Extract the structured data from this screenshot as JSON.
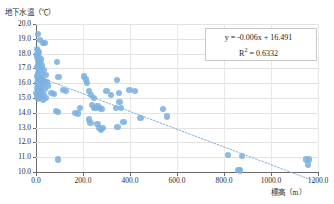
{
  "chart_data": {
    "type": "scatter",
    "title": "",
    "ylabel": "地下水温（℃）",
    "xlabel": "標高（m）",
    "xlim": [
      0,
      1200
    ],
    "ylim": [
      10.0,
      20.0
    ],
    "xticks": [
      "0.0",
      "200.0",
      "400.0",
      "600.0",
      "800.0",
      "1000.0",
      "1200.0"
    ],
    "xtick_values": [
      0,
      200,
      400,
      600,
      800,
      1000,
      1200
    ],
    "yticks": [
      "10.0",
      "11.0",
      "12.0",
      "13.0",
      "14.0",
      "15.0",
      "16.0",
      "17.0",
      "18.0",
      "19.0",
      "20.0"
    ],
    "ytick_values": [
      10,
      11,
      12,
      13,
      14,
      15,
      16,
      17,
      18,
      19,
      20
    ],
    "grid": true,
    "legend": "none",
    "marker_color": "#7cb0e0",
    "trendline_color": "#7cb0e0",
    "trendline": {
      "equation": "y = -0.006x + 16.491",
      "r_squared_label": "R",
      "r_squared_sup": "2",
      "r_squared_value": "= 0.6332",
      "slope": -0.006,
      "intercept": 16.491,
      "r2": 0.6332,
      "x_start": 0,
      "x_end": 1200
    },
    "points": [
      [
        8,
        19.3
      ],
      [
        18,
        18.9
      ],
      [
        30,
        18.7
      ],
      [
        36,
        18.7
      ],
      [
        5,
        18.3
      ],
      [
        9,
        18.2
      ],
      [
        12,
        18.1
      ],
      [
        6,
        17.95
      ],
      [
        4,
        17.8
      ],
      [
        14,
        17.75
      ],
      [
        22,
        17.6
      ],
      [
        8,
        17.5
      ],
      [
        88,
        17.45
      ],
      [
        16,
        17.4
      ],
      [
        10,
        17.25
      ],
      [
        26,
        17.2
      ],
      [
        5,
        17.1
      ],
      [
        19,
        17.0
      ],
      [
        34,
        16.9
      ],
      [
        12,
        16.85
      ],
      [
        7,
        16.7
      ],
      [
        24,
        16.6
      ],
      [
        41,
        16.55
      ],
      [
        96,
        16.4
      ],
      [
        3,
        16.45
      ],
      [
        15,
        16.35
      ],
      [
        28,
        16.3
      ],
      [
        9,
        16.2
      ],
      [
        20,
        16.15
      ],
      [
        45,
        16.1
      ],
      [
        36,
        16.05
      ],
      [
        6,
        16.0
      ],
      [
        14,
        15.95
      ],
      [
        30,
        15.9
      ],
      [
        52,
        15.85
      ],
      [
        11,
        15.8
      ],
      [
        23,
        15.75
      ],
      [
        4,
        15.7
      ],
      [
        38,
        15.6
      ],
      [
        17,
        15.55
      ],
      [
        8,
        15.45
      ],
      [
        27,
        15.4
      ],
      [
        2,
        15.35
      ],
      [
        13,
        15.25
      ],
      [
        32,
        15.2
      ],
      [
        6,
        15.1
      ],
      [
        21,
        15.05
      ],
      [
        44,
        15.0
      ],
      [
        10,
        14.95
      ],
      [
        29,
        14.9
      ],
      [
        66,
        15.35
      ],
      [
        75,
        15.25
      ],
      [
        115,
        15.55
      ],
      [
        128,
        15.5
      ],
      [
        205,
        16.45
      ],
      [
        212,
        16.25
      ],
      [
        218,
        16.0
      ],
      [
        225,
        15.45
      ],
      [
        234,
        15.2
      ],
      [
        247,
        15.0
      ],
      [
        300,
        15.45
      ],
      [
        318,
        15.2
      ],
      [
        345,
        16.2
      ],
      [
        352,
        15.35
      ],
      [
        398,
        15.55
      ],
      [
        420,
        15.5
      ],
      [
        86,
        14.1
      ],
      [
        92,
        14.05
      ],
      [
        165,
        14.0
      ],
      [
        178,
        13.95
      ],
      [
        186,
        14.35
      ],
      [
        238,
        14.55
      ],
      [
        246,
        14.35
      ],
      [
        254,
        14.3
      ],
      [
        262,
        14.45
      ],
      [
        272,
        14.3
      ],
      [
        279,
        14.25
      ],
      [
        340,
        14.3
      ],
      [
        355,
        14.75
      ],
      [
        362,
        14.3
      ],
      [
        372,
        13.4
      ],
      [
        347,
        13.05
      ],
      [
        262,
        13.25
      ],
      [
        270,
        13.0
      ],
      [
        276,
        12.85
      ],
      [
        284,
        13.0
      ],
      [
        225,
        13.55
      ],
      [
        232,
        13.3
      ],
      [
        445,
        13.65
      ],
      [
        540,
        14.25
      ],
      [
        558,
        13.75
      ],
      [
        92,
        10.85
      ],
      [
        818,
        11.15
      ],
      [
        876,
        11.1
      ],
      [
        862,
        10.15
      ],
      [
        868,
        10.1
      ],
      [
        1148,
        10.85
      ],
      [
        1162,
        10.85
      ],
      [
        1158,
        10.5
      ]
    ]
  }
}
